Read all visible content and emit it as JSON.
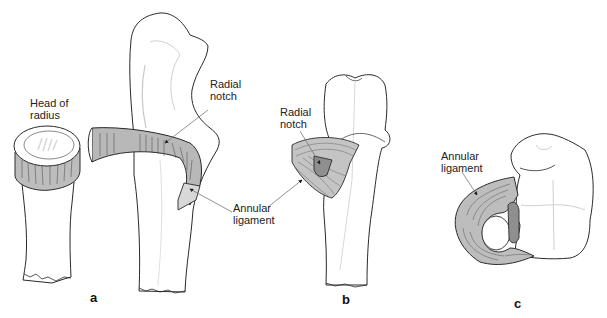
{
  "figure": {
    "panels": [
      {
        "id": "a",
        "letter": "a",
        "labels": {
          "head_of_radius": "Head of\nradius",
          "radial_notch": "Radial\nnotch",
          "annular_ligament": "Annular\nligament"
        }
      },
      {
        "id": "b",
        "letter": "b",
        "labels": {
          "radial_notch": "Radial\nnotch"
        }
      },
      {
        "id": "c",
        "letter": "c",
        "labels": {
          "annular_ligament": "Annular\nligament"
        }
      }
    ],
    "colors": {
      "outline": "#2a2a2a",
      "ligament_fill": "#b8b8b8",
      "notch_fill": "#8f8f8f",
      "leader_line": "#777777",
      "shading": "#e6e6e6"
    }
  }
}
